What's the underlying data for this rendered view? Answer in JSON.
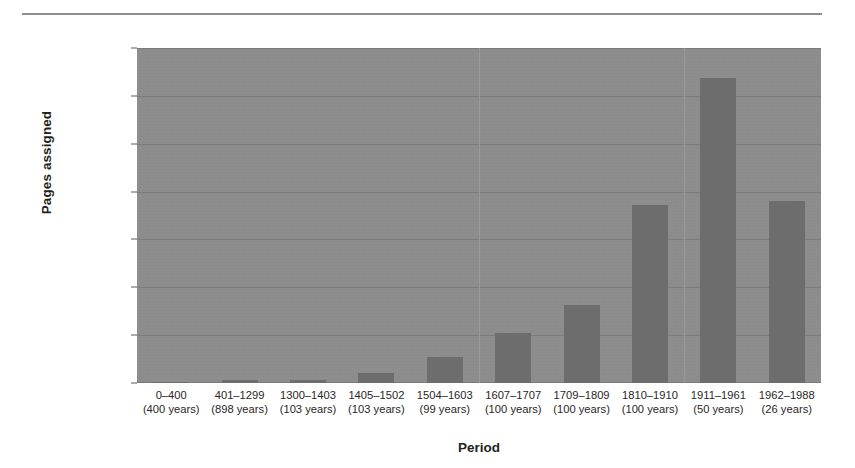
{
  "chart_data": {
    "type": "bar",
    "title": "",
    "xlabel": "Period",
    "ylabel": "Pages assigned",
    "ylim": [
      0,
      350
    ],
    "yticks": [
      0,
      50,
      100,
      150,
      200,
      250,
      300,
      350
    ],
    "grid": true,
    "legend": null,
    "bar_color": "#6d6d6d",
    "plot_background": "#8e8e8e",
    "categories": [
      "0–400",
      "401–1299",
      "1300–1403",
      "1405–1502",
      "1504–1603",
      "1607–1707",
      "1709–1809",
      "1810–1910",
      "1911–1961",
      "1962–1988"
    ],
    "category_sublabels": [
      "(400 years)",
      "(898 years)",
      "(103 years)",
      "(103 years)",
      "(99 years)",
      "(100 years)",
      "(100 years)",
      "(100 years)",
      "(50 years)",
      "(26 years)"
    ],
    "values": [
      1,
      3,
      3,
      10,
      27,
      52,
      81,
      186,
      319,
      190
    ]
  },
  "axis": {
    "y_title": "Pages assigned",
    "x_title": "Period"
  },
  "ytick_labels": [
    "350",
    "300",
    "250",
    "200",
    "150",
    "100",
    "50",
    "0"
  ]
}
